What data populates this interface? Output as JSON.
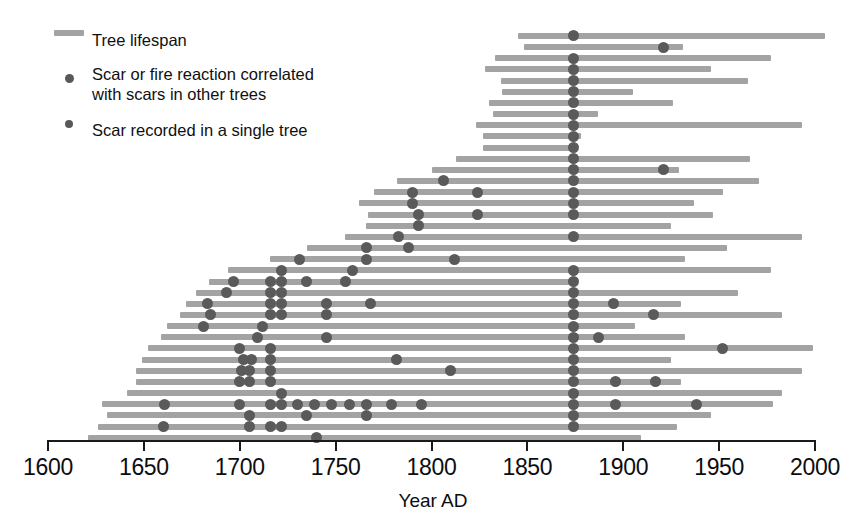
{
  "legend": {
    "items": [
      {
        "id": "lifespan",
        "marker": "line",
        "label": "Tree lifespan"
      },
      {
        "id": "correlated",
        "marker": "dot-large",
        "label": "Scar or fire reaction correlated\nwith scars in other trees"
      },
      {
        "id": "single",
        "marker": "dot-small",
        "label": "Scar recorded in a single tree"
      }
    ]
  },
  "axis": {
    "title": "Year AD",
    "ticks": [
      1600,
      1650,
      1700,
      1750,
      1800,
      1850,
      1900,
      1950,
      2000
    ],
    "min": 1600,
    "max": 2000
  },
  "colors": {
    "bar": "#a3a3a3",
    "scar": "#5a5a5a",
    "axis": "#1a1a1a",
    "text": "#0d0d0d",
    "background": "#ffffff"
  },
  "chart_data": {
    "type": "bar",
    "subtype": "fire-scar-chronology-horizontal-range",
    "title": "",
    "xlabel": "Year AD",
    "ylabel": "",
    "xlim": [
      1600,
      2005
    ],
    "grid": false,
    "legend_position": "top-left",
    "x_ticks": [
      1600,
      1650,
      1700,
      1750,
      1800,
      1850,
      1900,
      1950,
      2000
    ],
    "series_description": "Each horizontal bar is one tree's recorded lifespan; dots mark fire scars. Large dots = scar correlated with scars in other trees; small dots = scar recorded in a single tree.",
    "major_fire_year": 1874,
    "n_trees": 35,
    "trees": [
      {
        "row": 1,
        "start": 1845,
        "end": 2005,
        "scars": [
          1874
        ]
      },
      {
        "row": 2,
        "start": 1848,
        "end": 1931,
        "scars": [
          1921
        ]
      },
      {
        "row": 3,
        "start": 1833,
        "end": 1977,
        "scars": [
          1874
        ]
      },
      {
        "row": 4,
        "start": 1828,
        "end": 1946,
        "scars": [
          1874
        ]
      },
      {
        "row": 5,
        "start": 1836,
        "end": 1965,
        "scars": [
          1874
        ]
      },
      {
        "row": 6,
        "start": 1837,
        "end": 1905,
        "scars": [
          1874
        ]
      },
      {
        "row": 7,
        "start": 1830,
        "end": 1926,
        "scars": [
          1874
        ]
      },
      {
        "row": 8,
        "start": 1832,
        "end": 1887,
        "scars": [
          1874
        ]
      },
      {
        "row": 9,
        "start": 1823,
        "end": 1993,
        "scars": [
          1874
        ]
      },
      {
        "row": 10,
        "start": 1827,
        "end": 1878,
        "scars": [
          1874
        ]
      },
      {
        "row": 11,
        "start": 1827,
        "end": 1872,
        "scars": [
          1874
        ]
      },
      {
        "row": 12,
        "start": 1813,
        "end": 1966,
        "scars": [
          1874
        ]
      },
      {
        "row": 13,
        "start": 1800,
        "end": 1929,
        "scars": [
          1874,
          1921
        ]
      },
      {
        "row": 14,
        "start": 1782,
        "end": 1971,
        "scars": [
          1806,
          1874
        ]
      },
      {
        "row": 15,
        "start": 1770,
        "end": 1952,
        "scars": [
          1790,
          1824,
          1874
        ]
      },
      {
        "row": 16,
        "start": 1762,
        "end": 1937,
        "scars": [
          1790,
          1874
        ]
      },
      {
        "row": 17,
        "start": 1767,
        "end": 1947,
        "scars": [
          1793,
          1824,
          1874
        ]
      },
      {
        "row": 18,
        "start": 1766,
        "end": 1925,
        "scars": [
          1793
        ]
      },
      {
        "row": 19,
        "start": 1755,
        "end": 1993,
        "scars": [
          1783,
          1874
        ]
      },
      {
        "row": 20,
        "start": 1735,
        "end": 1954,
        "scars": [
          1766,
          1788
        ]
      },
      {
        "row": 21,
        "start": 1716,
        "end": 1932,
        "scars": [
          1731,
          1766,
          1812
        ]
      },
      {
        "row": 22,
        "start": 1694,
        "end": 1977,
        "scars": [
          1722,
          1759,
          1874
        ]
      },
      {
        "row": 23,
        "start": 1684,
        "end": 1874,
        "scars": [
          1697,
          1716,
          1722,
          1735,
          1755,
          1874
        ]
      },
      {
        "row": 24,
        "start": 1677,
        "end": 1960,
        "scars": [
          1693,
          1716,
          1722,
          1874
        ]
      },
      {
        "row": 25,
        "start": 1672,
        "end": 1930,
        "scars": [
          1683,
          1716,
          1722,
          1745,
          1768,
          1874,
          1895
        ]
      },
      {
        "row": 26,
        "start": 1669,
        "end": 1983,
        "scars": [
          1685,
          1716,
          1722,
          1745,
          1874,
          1916
        ]
      },
      {
        "row": 27,
        "start": 1662,
        "end": 1906,
        "scars": [
          1681,
          1712,
          1874
        ]
      },
      {
        "row": 28,
        "start": 1659,
        "end": 1932,
        "scars": [
          1709,
          1745,
          1874,
          1887
        ]
      },
      {
        "row": 29,
        "start": 1652,
        "end": 1999,
        "scars": [
          1700,
          1716,
          1874,
          1952
        ]
      },
      {
        "row": 30,
        "start": 1649,
        "end": 1925,
        "scars": [
          1702,
          1706,
          1716,
          1782,
          1874
        ]
      },
      {
        "row": 31,
        "start": 1646,
        "end": 1993,
        "scars": [
          1701,
          1705,
          1716,
          1810,
          1874
        ]
      },
      {
        "row": 32,
        "start": 1646,
        "end": 1930,
        "scars": [
          1700,
          1705,
          1716,
          1874,
          1896,
          1917
        ]
      },
      {
        "row": 33,
        "start": 1641,
        "end": 1983,
        "scars": [
          1722,
          1874
        ]
      },
      {
        "row": 34,
        "start": 1628,
        "end": 1978,
        "scars": [
          1661,
          1700,
          1716,
          1722,
          1730,
          1739,
          1748,
          1757,
          1766,
          1779,
          1795,
          1874,
          1896,
          1938
        ]
      },
      {
        "row": 35,
        "start": 1631,
        "end": 1946,
        "scars": [
          1705,
          1735,
          1766,
          1874
        ]
      },
      {
        "row": 36,
        "start": 1626,
        "end": 1928,
        "scars": [
          1660,
          1705,
          1716,
          1722,
          1874
        ]
      },
      {
        "row": 37,
        "start": 1621,
        "end": 1909,
        "scars": [
          1740
        ]
      }
    ]
  }
}
